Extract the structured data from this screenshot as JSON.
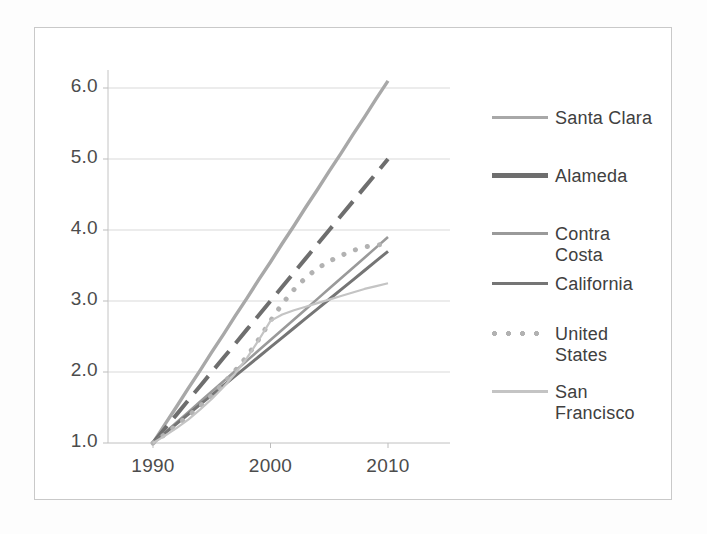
{
  "chart_data": {
    "type": "line",
    "title": "",
    "xlabel": "",
    "ylabel": "",
    "x": [
      1990,
      1991,
      1992,
      1993,
      1994,
      1995,
      1996,
      1997,
      1998,
      1999,
      2000,
      2001,
      2002,
      2003,
      2004,
      2005,
      2006,
      2007,
      2008,
      2009,
      2010
    ],
    "xlim": [
      1989,
      2011
    ],
    "ylim": [
      1.0,
      6.4
    ],
    "xticks": [
      "1990",
      "2000",
      "2010"
    ],
    "yticks": [
      "1.0",
      "2.0",
      "3.0",
      "4.0",
      "5.0",
      "6.0"
    ],
    "grid": "horizontal",
    "legend_position": "right",
    "series": [
      {
        "name": "Santa Clara",
        "color": "#a8a8a8",
        "style": "solid",
        "width": 3.4,
        "values": [
          1.0,
          1.26,
          1.51,
          1.77,
          2.02,
          2.28,
          2.53,
          2.79,
          3.04,
          3.3,
          3.55,
          3.81,
          4.06,
          4.32,
          4.57,
          4.83,
          5.08,
          5.34,
          5.59,
          5.85,
          6.1
        ]
      },
      {
        "name": "Alameda",
        "color": "#6e6e6e",
        "style": "dashed",
        "width": 4.0,
        "values": [
          1.0,
          1.2,
          1.4,
          1.6,
          1.8,
          2.0,
          2.2,
          2.4,
          2.6,
          2.8,
          3.0,
          3.2,
          3.4,
          3.6,
          3.8,
          4.0,
          4.2,
          4.4,
          4.6,
          4.8,
          5.0
        ]
      },
      {
        "name": "Contra Costa",
        "color": "#9a9a9a",
        "style": "solid",
        "width": 2.6,
        "values": [
          1.0,
          1.145,
          1.29,
          1.435,
          1.58,
          1.725,
          1.87,
          2.015,
          2.16,
          2.305,
          2.45,
          2.595,
          2.74,
          2.885,
          3.03,
          3.175,
          3.32,
          3.465,
          3.61,
          3.755,
          3.9
        ]
      },
      {
        "name": "California",
        "color": "#757575",
        "style": "solid",
        "width": 3.0,
        "values": [
          1.0,
          1.135,
          1.27,
          1.405,
          1.54,
          1.675,
          1.81,
          1.945,
          2.08,
          2.215,
          2.35,
          2.485,
          2.62,
          2.755,
          2.89,
          3.025,
          3.16,
          3.295,
          3.43,
          3.565,
          3.7
        ]
      },
      {
        "name": "United States",
        "color": "#b2b2b2",
        "style": "dotted",
        "width": 5.0,
        "values": [
          1.0,
          1.12,
          1.25,
          1.38,
          1.52,
          1.67,
          1.84,
          2.02,
          2.22,
          2.46,
          2.72,
          2.96,
          3.16,
          3.33,
          3.46,
          3.56,
          3.64,
          3.71,
          3.76,
          3.79,
          3.8
        ]
      },
      {
        "name": "San Francisco",
        "color": "#c4c4c4",
        "style": "solid",
        "width": 2.2,
        "values": [
          1.0,
          1.1,
          1.21,
          1.33,
          1.47,
          1.62,
          1.79,
          1.98,
          2.2,
          2.45,
          2.72,
          2.81,
          2.87,
          2.92,
          2.97,
          3.02,
          3.07,
          3.12,
          3.17,
          3.21,
          3.25
        ]
      }
    ]
  },
  "axis": {
    "y_labels": [
      "6.0",
      "5.0",
      "4.0",
      "3.0",
      "2.0",
      "1.0"
    ],
    "x_labels": [
      "1990",
      "2000",
      "2010"
    ]
  },
  "legend": {
    "items": [
      {
        "label": "Santa Clara",
        "style": "solid",
        "color": "#a8a8a8"
      },
      {
        "label": "Alameda",
        "style": "dashed",
        "color": "#6e6e6e"
      },
      {
        "label": "Contra\nCosta",
        "style": "solid",
        "color": "#9a9a9a"
      },
      {
        "label": "California",
        "style": "solid",
        "color": "#757575"
      },
      {
        "label": "United\nStates",
        "style": "dotted",
        "color": "#b2b2b2"
      },
      {
        "label": "San\nFrancisco",
        "style": "solid",
        "color": "#c4c4c4"
      }
    ]
  }
}
